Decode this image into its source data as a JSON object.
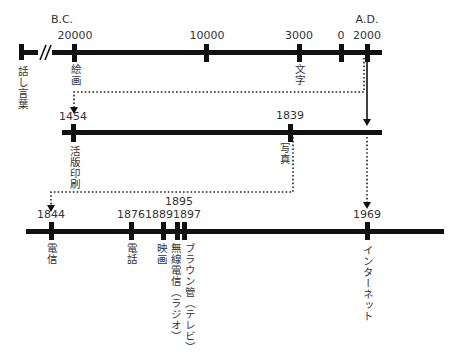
{
  "timelines": [
    {
      "id": "ancient",
      "era_labels": [
        {
          "text": "B.C.",
          "x": 46,
          "y": 14
        },
        {
          "text": "A.D.",
          "x": 367,
          "y": 14
        }
      ],
      "events": [
        {
          "year": "",
          "label": "話し言葉",
          "x": 21
        },
        {
          "year": "20000",
          "label": "絵画",
          "x": 75
        },
        {
          "year": "10000",
          "label": "",
          "x": 207
        },
        {
          "year": "3000",
          "label": "文字",
          "x": 299
        },
        {
          "year": "0",
          "label": "",
          "x": 341
        },
        {
          "year": "2000",
          "label": "",
          "x": 367
        }
      ],
      "break_mark": "//"
    },
    {
      "id": "printing",
      "events": [
        {
          "year": "1454",
          "label": "活版印刷",
          "x": 73
        },
        {
          "year": "1839",
          "label": "写真",
          "x": 290
        }
      ]
    },
    {
      "id": "modern",
      "events": [
        {
          "year": "1844",
          "label": "電信",
          "x": 51
        },
        {
          "year": "1876",
          "label": "電話",
          "x": 131
        },
        {
          "year": "1889",
          "label": "映画",
          "x": 163
        },
        {
          "year": "1895",
          "label": "無線電信（ラジオ）",
          "x": 177
        },
        {
          "year": "1897",
          "label": "ブラウン管（テレビ）",
          "x": 184
        },
        {
          "year": "1969",
          "label": "インターネット",
          "x": 367
        }
      ],
      "year_labels_combined": {
        "upper": "1895",
        "lower": "18891897"
      }
    }
  ]
}
